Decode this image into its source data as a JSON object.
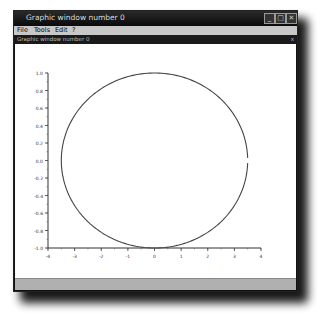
{
  "window": {
    "title": "Graphic window number 0",
    "subtitle": "Graphic window number 0",
    "subtitle_close": "x",
    "buttons": {
      "minimize": "_",
      "maximize": "□",
      "close": "✕"
    }
  },
  "menubar": {
    "items": [
      {
        "label": "File"
      },
      {
        "label": "Tools"
      },
      {
        "label": "Edit"
      },
      {
        "label": "?"
      }
    ]
  },
  "chart_data": {
    "type": "line",
    "title": "",
    "xlabel": "",
    "ylabel": "",
    "xlim": [
      -4,
      4
    ],
    "ylim": [
      -1.0,
      1.0
    ],
    "x_ticks": [
      "-4",
      "-3",
      "-2",
      "-1",
      "0",
      "1",
      "2",
      "3",
      "4"
    ],
    "y_ticks": [
      "1.0",
      "0.8",
      "0.6",
      "0.4",
      "0.2",
      "0.0",
      "-0.2",
      "-0.4",
      "-0.6",
      "-0.8",
      "-1.0"
    ],
    "grid": false,
    "series": [
      {
        "name": "ellipse",
        "description": "Parametric curve x = 3.5*cos(t), y = sin(t), t in [0, 2*pi), drawn as a dark gray line",
        "x": [
          3.5,
          3.03,
          1.75,
          0.0,
          -1.75,
          -3.03,
          -3.5,
          -3.03,
          -1.75,
          0.0,
          1.75,
          3.03,
          3.5
        ],
        "y": [
          0.0,
          0.5,
          0.866,
          1.0,
          0.866,
          0.5,
          0.0,
          -0.5,
          -0.866,
          -1.0,
          -0.866,
          -0.5,
          0.0
        ]
      }
    ]
  }
}
